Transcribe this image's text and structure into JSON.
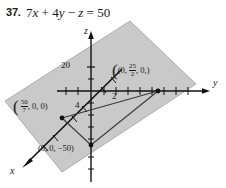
{
  "figure": {
    "problem_number": "37.",
    "equation": {
      "full": "7x + 4y - z = 50",
      "terms": [
        "7",
        "x",
        "+",
        "4",
        "y",
        "−",
        "z",
        "=",
        "50"
      ]
    },
    "axes": {
      "x_label": "x",
      "y_label": "y",
      "z_label": "z"
    },
    "tick_labels": {
      "z_tick": "20",
      "y_tick": "2",
      "x_tick": "4"
    },
    "intercepts": [
      {
        "name": "y-intercept",
        "text_prefix": "(0,",
        "fraction_numerator": "25",
        "fraction_denominator": "2",
        "text_suffix": ", 0,)",
        "value": [
          0,
          12.5,
          0
        ]
      },
      {
        "name": "x-intercept",
        "text_prefix": "(",
        "fraction_numerator": "50",
        "fraction_denominator": "7",
        "text_suffix": ", 0, 0)",
        "value": [
          7.142857,
          0,
          0
        ]
      },
      {
        "name": "z-intercept",
        "text": "(0, 0, −50)",
        "value": [
          0,
          0,
          -50
        ]
      }
    ],
    "colors": {
      "plane_fill": "#c9c9c9",
      "plane_stroke": "#9a9a9a",
      "axis": "#111111",
      "text": "#1a1a1a",
      "triangle_stroke": "#3a3a3a"
    }
  }
}
